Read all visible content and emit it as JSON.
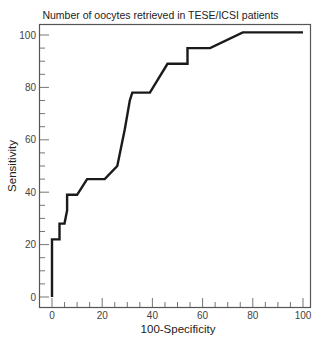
{
  "chart_data": {
    "type": "line",
    "title": "Number of oocytes retrieved in TESE/ICSI patients",
    "xlabel": "100-Specificity",
    "ylabel": "Sensitivity",
    "xlim": [
      0,
      100
    ],
    "ylim": [
      0,
      100
    ],
    "x_ticks": [
      "0",
      "20",
      "40",
      "60",
      "80",
      "100"
    ],
    "y_ticks": [
      "0",
      "20",
      "40",
      "60",
      "80",
      "100"
    ],
    "grid": false,
    "legend": null,
    "series": [
      {
        "name": "ROC curve",
        "color": "#1a1a1a",
        "points": [
          [
            0,
            0
          ],
          [
            0,
            22
          ],
          [
            3,
            22
          ],
          [
            3,
            28
          ],
          [
            5,
            28
          ],
          [
            6,
            33
          ],
          [
            6,
            39
          ],
          [
            10,
            39
          ],
          [
            14,
            45
          ],
          [
            21,
            45
          ],
          [
            26,
            50
          ],
          [
            29,
            64
          ],
          [
            31,
            75
          ],
          [
            32,
            78
          ],
          [
            39,
            78
          ],
          [
            46,
            89
          ],
          [
            54,
            89
          ],
          [
            54,
            95
          ],
          [
            63,
            95
          ],
          [
            76,
            101
          ],
          [
            100,
            101
          ]
        ]
      }
    ]
  }
}
